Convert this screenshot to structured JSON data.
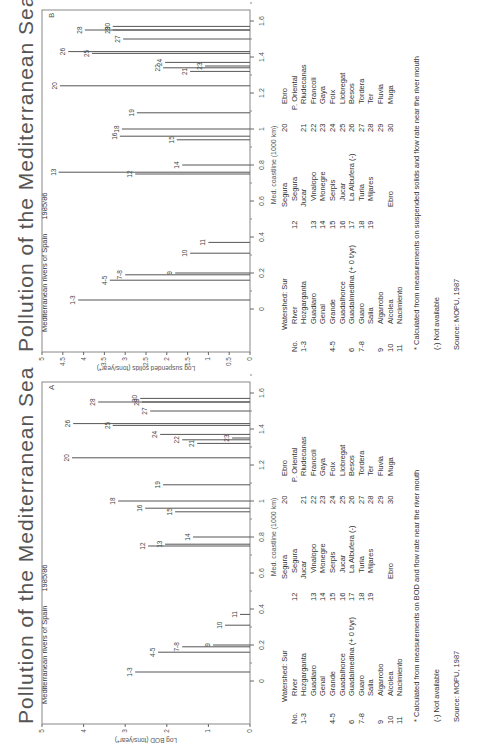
{
  "panels": [
    {
      "id": "B",
      "title": "Pollution of the Mediterranean Sea",
      "subtitle": "Mediterranean rivers of Spain",
      "year": "1985/86",
      "panel_letter": "B",
      "ylabel": "Log suspended solids (tons/year*)",
      "xlabel": "Med. coastline (1000 km)",
      "footnote": "* Calculated from measurements on suspended solids and flow rate near the river mouth"
    },
    {
      "id": "A",
      "title": "Pollution of the Mediterranean Sea",
      "subtitle": "Mediterranean rivers of Spain",
      "year": "1985/86",
      "panel_letter": "A",
      "ylabel": "Log BOD (tons/year*)",
      "xlabel": "Med. coastline (1000 km)",
      "footnote": "* Calculated from measurements on BOD and flow rate near the river mouth"
    }
  ],
  "legend": {
    "col1": [
      {
        "no": "",
        "name": "Watershed: Sur",
        "indent": 0
      },
      {
        "no": "No.",
        "name": "River",
        "indent": 1
      },
      {
        "no": "1-3",
        "name": "Hozgarganta",
        "indent": 1
      },
      {
        "no": "",
        "name": "Guadiaro",
        "indent": 1
      },
      {
        "no": "",
        "name": "Genal",
        "indent": 1
      },
      {
        "no": "4-5",
        "name": "Grande",
        "indent": 1
      },
      {
        "no": "",
        "name": "Guadalhorce",
        "indent": 1
      },
      {
        "no": "6",
        "name": "Guadalmedina (+ 0 t/yr)",
        "indent": 1
      },
      {
        "no": "7-8",
        "name": "Guaro",
        "indent": 1
      },
      {
        "no": "",
        "name": "Salia",
        "indent": 1
      },
      {
        "no": "9",
        "name": "Algarrobo",
        "indent": 1
      },
      {
        "no": "10",
        "name": "Alcolea",
        "indent": 1
      },
      {
        "no": "11",
        "name": "Nacimiento",
        "indent": 1
      }
    ],
    "col2": [
      {
        "no": "",
        "name": "Segura",
        "indent": 0
      },
      {
        "no": "12",
        "name": "Segura",
        "indent": 1
      },
      {
        "no": "",
        "name": "Jucar",
        "indent": 0
      },
      {
        "no": "13",
        "name": "Vinalopo",
        "indent": 1
      },
      {
        "no": "14",
        "name": "Monegre",
        "indent": 1
      },
      {
        "no": "15",
        "name": "Serpis",
        "indent": 1
      },
      {
        "no": "16",
        "name": "Jucar",
        "indent": 1
      },
      {
        "no": "17",
        "name": "La Albufera (-)",
        "indent": 1
      },
      {
        "no": "18",
        "name": "Turia",
        "indent": 1
      },
      {
        "no": "19",
        "name": "Mijares",
        "indent": 1
      },
      {
        "no": "",
        "name": "",
        "indent": 1
      },
      {
        "no": "",
        "name": "Ebro",
        "indent": 0
      }
    ],
    "col3": [
      {
        "no": "20",
        "name": "Ebro",
        "indent": 1
      },
      {
        "no": "",
        "name": "P. Oriental",
        "indent": 0
      },
      {
        "no": "21",
        "name": "Riudecanas",
        "indent": 1
      },
      {
        "no": "22",
        "name": "Francoli",
        "indent": 1
      },
      {
        "no": "23",
        "name": "Gaya",
        "indent": 1
      },
      {
        "no": "24",
        "name": "Foix",
        "indent": 1
      },
      {
        "no": "25",
        "name": "Llobregat",
        "indent": 1
      },
      {
        "no": "26",
        "name": "Besos",
        "indent": 1
      },
      {
        "no": "27",
        "name": "Tordera",
        "indent": 1
      },
      {
        "no": "28",
        "name": "Ter",
        "indent": 1
      },
      {
        "no": "29",
        "name": "Fluvia",
        "indent": 1
      },
      {
        "no": "30",
        "name": "Muga",
        "indent": 1
      }
    ],
    "not_available": "(-) Not available",
    "source": "Source: MOPU, 1987"
  },
  "chart_data": [
    {
      "type": "bar",
      "title": "Pollution of the Mediterranean Sea — Mediterranean rivers of Spain 1985/86 (B)",
      "xlabel": "Med. coastline (1000 km)",
      "ylabel": "Log suspended solids (tons/year*)",
      "xlim": [
        0,
        1.7
      ],
      "ylim": [
        0,
        5
      ],
      "xticks": [
        0,
        0.2,
        0.4,
        0.6,
        0.8,
        1,
        1.2,
        1.4,
        1.6
      ],
      "yticks": [
        0,
        0.5,
        1,
        1.5,
        2,
        2.5,
        3,
        3.5,
        4,
        4.5,
        5
      ],
      "grid": false,
      "orientation": "rotated page, bars drawn as stems from coastline axis",
      "points": [
        {
          "label": "1-3",
          "x": 0.05,
          "y": 4.13
        },
        {
          "label": "4-5",
          "x": 0.16,
          "y": 3.37
        },
        {
          "label": "7-8",
          "x": 0.19,
          "y": 3.0
        },
        {
          "label": "9",
          "x": 0.2,
          "y": 1.8
        },
        {
          "label": "10",
          "x": 0.31,
          "y": 1.44
        },
        {
          "label": "11",
          "x": 0.37,
          "y": 1.0
        },
        {
          "label": "12",
          "x": 0.75,
          "y": 2.76
        },
        {
          "label": "13",
          "x": 0.76,
          "y": 4.6
        },
        {
          "label": "14",
          "x": 0.8,
          "y": 1.63
        },
        {
          "label": "15",
          "x": 0.94,
          "y": 1.76
        },
        {
          "label": "16",
          "x": 0.96,
          "y": 3.13
        },
        {
          "label": "18",
          "x": 1.0,
          "y": 3.08
        },
        {
          "label": "19",
          "x": 1.09,
          "y": 2.72
        },
        {
          "label": "20",
          "x": 1.24,
          "y": 4.57
        },
        {
          "label": "21",
          "x": 1.32,
          "y": 1.44
        },
        {
          "label": "22",
          "x": 1.34,
          "y": 2.09
        },
        {
          "label": "23",
          "x": 1.35,
          "y": 1.08
        },
        {
          "label": "24",
          "x": 1.37,
          "y": 2.04
        },
        {
          "label": "25",
          "x": 1.42,
          "y": 3.8
        },
        {
          "label": "26",
          "x": 1.43,
          "y": 4.37
        },
        {
          "label": "27",
          "x": 1.5,
          "y": 3.05
        },
        {
          "label": "28",
          "x": 1.55,
          "y": 3.97
        },
        {
          "label": "29",
          "x": 1.55,
          "y": 3.3
        },
        {
          "label": "30",
          "x": 1.57,
          "y": 3.3
        }
      ]
    },
    {
      "type": "bar",
      "title": "Pollution of the Mediterranean Sea — Mediterranean rivers of Spain 1985/86 (A)",
      "xlabel": "Med. coastline (1000 km)",
      "ylabel": "Log BOD (tons/year*)",
      "xlim": [
        0,
        1.7
      ],
      "ylim": [
        0,
        5
      ],
      "xticks": [
        0,
        0.2,
        0.4,
        0.6,
        0.8,
        1,
        1.2,
        1.4,
        1.6
      ],
      "yticks": [
        0,
        1,
        2,
        3,
        4,
        5
      ],
      "grid": false,
      "orientation": "rotated page, bars drawn as stems from coastline axis",
      "points": [
        {
          "label": "1-3",
          "x": 0.05,
          "y": 2.76
        },
        {
          "label": "4-5",
          "x": 0.16,
          "y": 2.21
        },
        {
          "label": "7-8",
          "x": 0.19,
          "y": 1.63
        },
        {
          "label": "9",
          "x": 0.2,
          "y": 0.89
        },
        {
          "label": "10",
          "x": 0.31,
          "y": 0.6
        },
        {
          "label": "11",
          "x": 0.37,
          "y": 0.24
        },
        {
          "label": "12",
          "x": 0.75,
          "y": 2.45
        },
        {
          "label": "13",
          "x": 0.76,
          "y": 2.04
        },
        {
          "label": "14",
          "x": 0.8,
          "y": 1.37
        },
        {
          "label": "15",
          "x": 0.94,
          "y": 1.8
        },
        {
          "label": "16",
          "x": 0.96,
          "y": 2.52
        },
        {
          "label": "18",
          "x": 1.0,
          "y": 3.17
        },
        {
          "label": "19",
          "x": 1.09,
          "y": 2.09
        },
        {
          "label": "20",
          "x": 1.24,
          "y": 4.28
        },
        {
          "label": "21",
          "x": 1.32,
          "y": 1.27
        },
        {
          "label": "22",
          "x": 1.34,
          "y": 1.63
        },
        {
          "label": "23",
          "x": 1.35,
          "y": 0.43
        },
        {
          "label": "24",
          "x": 1.37,
          "y": 2.16
        },
        {
          "label": "25",
          "x": 1.42,
          "y": 3.3
        },
        {
          "label": "26",
          "x": 1.43,
          "y": 4.25
        },
        {
          "label": "27",
          "x": 1.5,
          "y": 2.4
        },
        {
          "label": "28",
          "x": 1.55,
          "y": 3.65
        },
        {
          "label": "29",
          "x": 1.55,
          "y": 2.6
        },
        {
          "label": "30",
          "x": 1.57,
          "y": 2.64
        }
      ]
    }
  ]
}
